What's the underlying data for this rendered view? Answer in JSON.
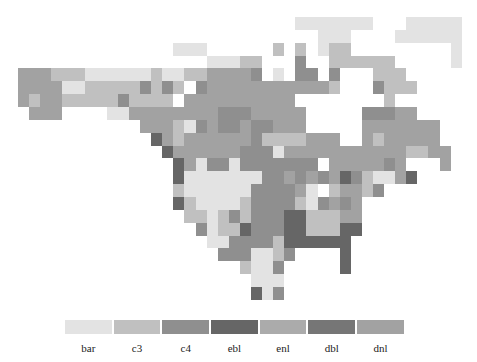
{
  "map": {
    "title": "",
    "grid": {
      "cols": 40,
      "rows": 22,
      "key": {
        ".": "empty",
        "b": "bar",
        "3": "c3",
        "4": "c4",
        "e": "ebl",
        "n": "enl",
        "d": "dbl",
        "l": "dnl"
      },
      "data": [
        ".........................bbbbbbb...bbbbb",
        "...........................bbb....bbbbbb",
        "..............bbb......3.3.b33.........b",
        ".................bbb33...4..333333.....b",
        "lll333bbbbbb3bb33llll4.b.44.4...333.....",
        "llllbb333334343.4lllllllllll3...4333....",
        "l3ll33333433331llllllllll........3.....",
        ".lll....bbllllllll444lllll.....444ll....",
        "...........lll3b4l44l44lll.....lllllll..",
        "............el3llllll43333lll..l3lllll..",
        ".............ellllll444blllllllllll33ll.",
        "..............elb44b4444444.lllll4l...l.",
        "..............ebbbbbbb44l4l4le43bble....",
        "..............3bbbbbb4444lb.3ll34.......",
        "..............e3bbbb344443b4l4l.........",
        "...............33b343444ee333ll.........",
        "................4b33e444ee333ee.........",
        ".................bb44443eeeeee..........",
        "..................444bb34....e..........",
        "....................3bb4.....e..........",
        ".....................bbb................",
        ".....................eb4................"
      ]
    },
    "colors": {
      "bar": "#e3e3e3",
      "c3": "#c0c0c0",
      "c4": "#8f8f8f",
      "ebl": "#666666",
      "enl": "#ababab",
      "dbl": "#767676",
      "dnl": "#a2a2a2"
    }
  },
  "legend": {
    "items": [
      {
        "label": "bar",
        "color": "#e3e3e3"
      },
      {
        "label": "c3",
        "color": "#c0c0c0"
      },
      {
        "label": "c4",
        "color": "#8f8f8f"
      },
      {
        "label": "ebl",
        "color": "#666666"
      },
      {
        "label": "enl",
        "color": "#ababab"
      },
      {
        "label": "dbl",
        "color": "#767676"
      },
      {
        "label": "dnl",
        "color": "#a2a2a2"
      }
    ]
  }
}
